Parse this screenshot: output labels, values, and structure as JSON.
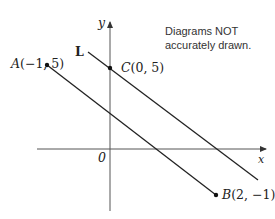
{
  "diagram": {
    "note": [
      "Diagrams NOT",
      "accurately drawn."
    ],
    "axes": {
      "x_label": "x",
      "y_label": "y",
      "origin_label": "0"
    },
    "points": {
      "A": {
        "name": "A",
        "coords": "(−1, 5)"
      },
      "B": {
        "name": "B",
        "coords": "(2, −1)"
      },
      "C": {
        "name": "C",
        "coords": "(0, 5)"
      }
    },
    "line_label": "L",
    "colors": {
      "stroke": "#222222",
      "axis": "#555555",
      "background": "#ffffff"
    }
  }
}
